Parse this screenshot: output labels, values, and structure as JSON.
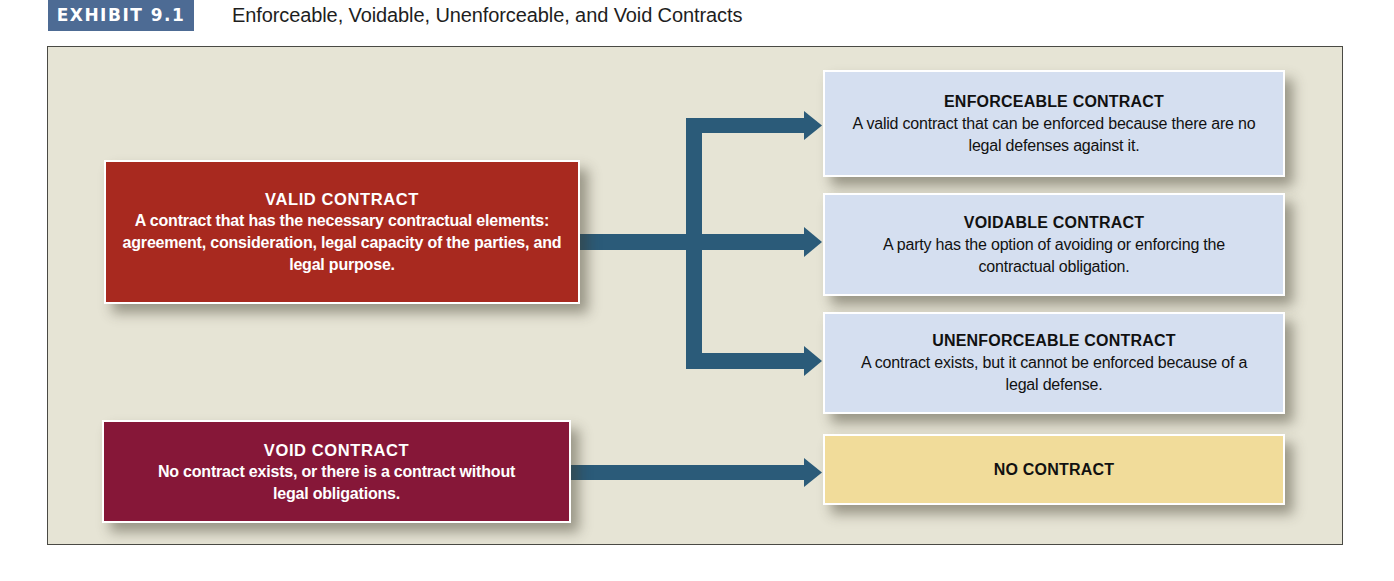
{
  "exhibit": {
    "badge": "EXHIBIT 9.1",
    "title": "Enforceable, Voidable, Unenforceable, and Void Contracts"
  },
  "colors": {
    "badge_bg": "#4d6b94",
    "frame_bg": "#e6e4d5",
    "valid_box": "#a8291f",
    "void_box": "#861738",
    "outcome_box": "#d5dff0",
    "no_contract_box": "#f1dc9a",
    "arrow": "#2b5b79"
  },
  "diagram": {
    "sources": [
      {
        "id": "valid",
        "title": "VALID CONTRACT",
        "description": "A contract that has the necessary contractual elements: agreement, consideration, legal capacity of the parties, and legal purpose."
      },
      {
        "id": "void",
        "title": "VOID CONTRACT",
        "description": "No contract exists, or there is a contract without legal obligations."
      }
    ],
    "outcomes": [
      {
        "id": "enforceable",
        "title": "ENFORCEABLE CONTRACT",
        "description": "A valid contract that can be enforced because there are no legal defenses against it."
      },
      {
        "id": "voidable",
        "title": "VOIDABLE CONTRACT",
        "description": "A party has the option of avoiding or enforcing the contractual obligation."
      },
      {
        "id": "unenforceable",
        "title": "UNENFORCEABLE CONTRACT",
        "description": "A contract exists, but it cannot be enforced because of a legal defense."
      },
      {
        "id": "no_contract",
        "title": "NO CONTRACT",
        "description": ""
      }
    ],
    "edges": [
      {
        "from": "valid",
        "to": "enforceable"
      },
      {
        "from": "valid",
        "to": "voidable"
      },
      {
        "from": "valid",
        "to": "unenforceable"
      },
      {
        "from": "void",
        "to": "no_contract"
      }
    ]
  }
}
